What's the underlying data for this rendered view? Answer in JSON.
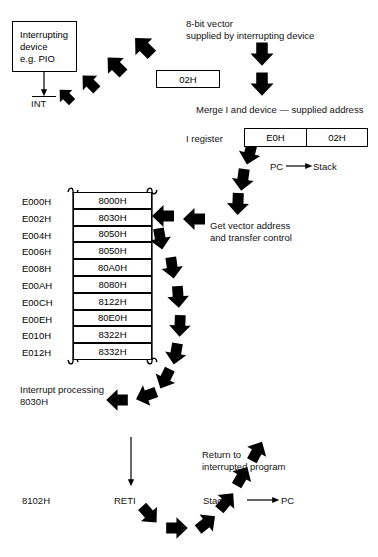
{
  "diagram": {
    "background": "#ffffff",
    "ink": "#000000"
  },
  "device_box": {
    "line1": "Interrupting",
    "line2": "device",
    "line3": "e.g. PIO",
    "signal_label": "INT",
    "signal_active_low": true
  },
  "vector": {
    "caption_line1": "8-bit vector",
    "caption_line2": "supplied by interrupting device",
    "value": "02H"
  },
  "merge": {
    "caption": "Merge I and device — supplied address",
    "register_label": "I register",
    "high_byte": "E0H",
    "low_byte": "02H"
  },
  "stack_push": {
    "label_left": "PC",
    "label_right": "Stack",
    "arrow": "→"
  },
  "fetch": {
    "line1": "Get vector address",
    "line2": "and transfer control"
  },
  "memory_table": {
    "addresses": [
      "E000H",
      "E002H",
      "E004H",
      "E006H",
      "E008H",
      "E00AH",
      "E00CH",
      "E00EH",
      "E010H",
      "E012H"
    ],
    "values": [
      "8000H",
      "8030H",
      "8050H",
      "8050H",
      "80A0H",
      "8080H",
      "8122H",
      "80E0H",
      "8322H",
      "8332H"
    ],
    "highlighted_row_index": 1,
    "truncated_top": true,
    "truncated_bottom": true
  },
  "isr": {
    "line1": "Interrupt processing",
    "line2": "8030H"
  },
  "return": {
    "address": "8102H",
    "instruction": "RETI",
    "caption_line1": "Return to",
    "caption_line2": "interrupted program",
    "pop_left": "Stack",
    "pop_right": "PC",
    "pop_arrow": "→"
  }
}
